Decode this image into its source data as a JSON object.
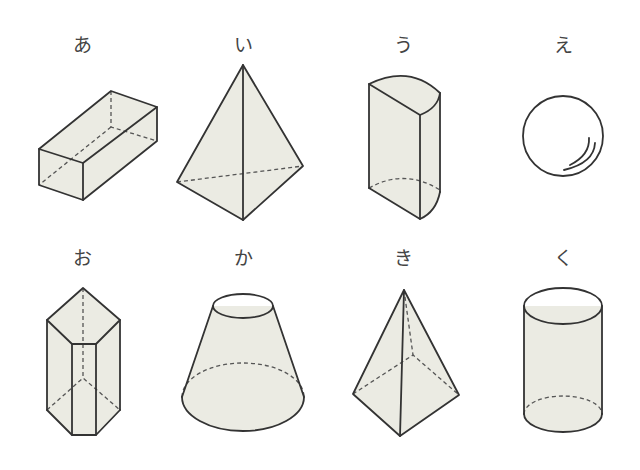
{
  "figure": {
    "colors": {
      "fill": "#ebebe3",
      "stroke": "#333333",
      "background": "#ffffff"
    },
    "shapes": [
      {
        "id": "a",
        "label": "あ",
        "name": "rectangular-prism"
      },
      {
        "id": "i",
        "label": "い",
        "name": "triangular-pyramid"
      },
      {
        "id": "u",
        "label": "う",
        "name": "half-cylinder"
      },
      {
        "id": "e",
        "label": "え",
        "name": "sphere"
      },
      {
        "id": "o",
        "label": "お",
        "name": "pentagonal-prism"
      },
      {
        "id": "ka",
        "label": "か",
        "name": "truncated-cone"
      },
      {
        "id": "ki",
        "label": "き",
        "name": "square-pyramid"
      },
      {
        "id": "ku",
        "label": "く",
        "name": "cylinder"
      }
    ]
  }
}
